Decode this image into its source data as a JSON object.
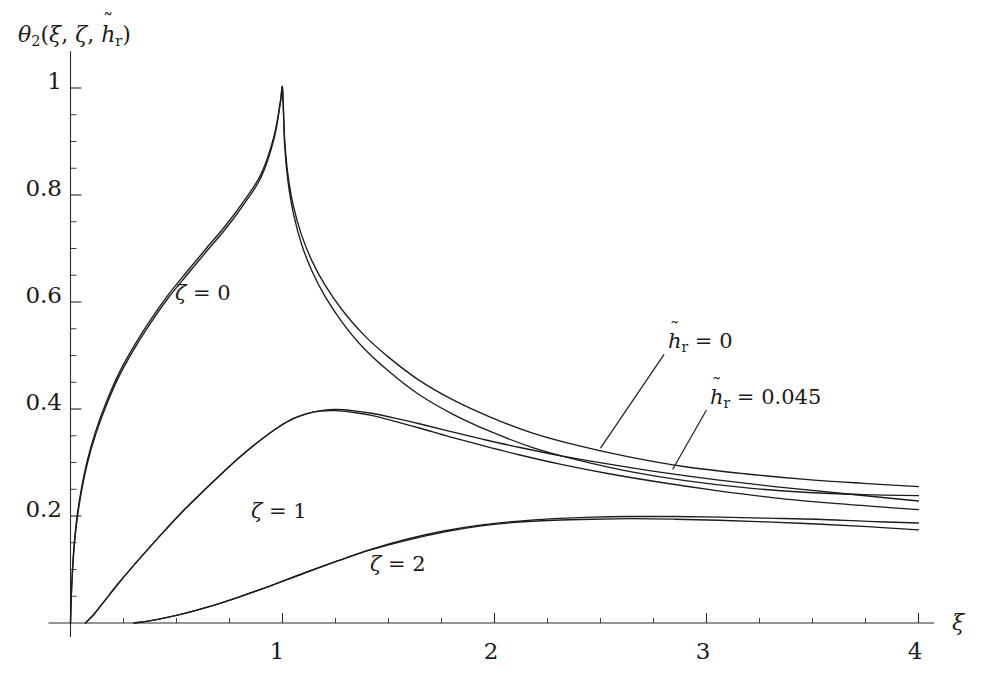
{
  "chart_data": {
    "type": "line",
    "title": "",
    "xlabel": "xi",
    "ylabel": "theta_2(xi, zeta, h_r_tilde)",
    "xlim": [
      0,
      4.05
    ],
    "ylim": [
      0,
      1.05
    ],
    "grid": false,
    "legend_position": "inline-annotations",
    "x_ticks_major": [
      0,
      1,
      2,
      3,
      4
    ],
    "x_tick_labels": [
      "",
      "1",
      "2",
      "3",
      "4"
    ],
    "x_minor_step": 0.25,
    "y_ticks_major": [
      0.2,
      0.4,
      0.6,
      0.8,
      1
    ],
    "y_tick_labels": [
      "0.2",
      "0.4",
      "0.6",
      "0.8",
      "1"
    ],
    "y_minor_step": 0.05,
    "annotations": [
      {
        "text": "h_r_tilde = 0",
        "x": 2.95,
        "y": 0.5
      },
      {
        "text": "h_r_tilde = 0.045",
        "x": 3.3,
        "y": 0.41
      },
      {
        "text": "zeta = 0",
        "x": 0.72,
        "y": 0.545
      },
      {
        "text": "zeta = 1",
        "x": 1.16,
        "y": 0.205
      },
      {
        "text": "zeta = 2",
        "x": 1.72,
        "y": 0.105
      }
    ],
    "series": [
      {
        "name": "zeta=0, h_r_tilde=0",
        "points": [
          [
            0.0,
            0.0
          ],
          [
            0.004,
            0.055
          ],
          [
            0.01,
            0.105
          ],
          [
            0.018,
            0.15
          ],
          [
            0.03,
            0.196
          ],
          [
            0.05,
            0.248
          ],
          [
            0.08,
            0.305
          ],
          [
            0.12,
            0.36
          ],
          [
            0.17,
            0.414
          ],
          [
            0.23,
            0.468
          ],
          [
            0.3,
            0.518
          ],
          [
            0.38,
            0.568
          ],
          [
            0.46,
            0.613
          ],
          [
            0.55,
            0.657
          ],
          [
            0.64,
            0.7
          ],
          [
            0.73,
            0.742
          ],
          [
            0.82,
            0.79
          ],
          [
            0.9,
            0.84
          ],
          [
            0.96,
            0.91
          ],
          [
            0.99,
            0.975
          ],
          [
            1.0,
            1.0
          ],
          [
            1.01,
            0.905
          ],
          [
            1.025,
            0.84
          ],
          [
            1.05,
            0.782
          ],
          [
            1.09,
            0.725
          ],
          [
            1.14,
            0.676
          ],
          [
            1.2,
            0.632
          ],
          [
            1.28,
            0.586
          ],
          [
            1.38,
            0.54
          ],
          [
            1.5,
            0.497
          ],
          [
            1.64,
            0.455
          ],
          [
            1.8,
            0.418
          ],
          [
            1.98,
            0.385
          ],
          [
            2.18,
            0.355
          ],
          [
            2.4,
            0.331
          ],
          [
            2.64,
            0.31
          ],
          [
            2.9,
            0.292
          ],
          [
            3.18,
            0.279
          ],
          [
            3.48,
            0.268
          ],
          [
            3.74,
            0.261
          ],
          [
            4.0,
            0.255
          ]
        ]
      },
      {
        "name": "zeta=0, h_r_tilde=0.045",
        "points": [
          [
            0.0,
            0.0
          ],
          [
            0.004,
            0.052
          ],
          [
            0.01,
            0.1
          ],
          [
            0.018,
            0.145
          ],
          [
            0.03,
            0.19
          ],
          [
            0.05,
            0.242
          ],
          [
            0.08,
            0.299
          ],
          [
            0.12,
            0.354
          ],
          [
            0.17,
            0.408
          ],
          [
            0.23,
            0.462
          ],
          [
            0.3,
            0.512
          ],
          [
            0.38,
            0.562
          ],
          [
            0.46,
            0.607
          ],
          [
            0.55,
            0.651
          ],
          [
            0.64,
            0.694
          ],
          [
            0.73,
            0.736
          ],
          [
            0.82,
            0.784
          ],
          [
            0.9,
            0.834
          ],
          [
            0.96,
            0.905
          ],
          [
            0.99,
            0.972
          ],
          [
            1.0,
            0.998
          ],
          [
            1.01,
            0.895
          ],
          [
            1.025,
            0.828
          ],
          [
            1.05,
            0.768
          ],
          [
            1.09,
            0.708
          ],
          [
            1.14,
            0.657
          ],
          [
            1.2,
            0.611
          ],
          [
            1.28,
            0.563
          ],
          [
            1.38,
            0.515
          ],
          [
            1.5,
            0.471
          ],
          [
            1.64,
            0.428
          ],
          [
            1.8,
            0.391
          ],
          [
            1.98,
            0.358
          ],
          [
            2.18,
            0.328
          ],
          [
            2.4,
            0.304
          ],
          [
            2.64,
            0.283
          ],
          [
            2.9,
            0.266
          ],
          [
            3.18,
            0.253
          ],
          [
            3.48,
            0.244
          ],
          [
            3.74,
            0.24
          ],
          [
            4.0,
            0.238
          ]
        ]
      },
      {
        "name": "zeta=1, h_r_tilde=0",
        "points": [
          [
            0.07,
            0.0
          ],
          [
            0.11,
            0.016
          ],
          [
            0.16,
            0.041
          ],
          [
            0.22,
            0.071
          ],
          [
            0.29,
            0.104
          ],
          [
            0.37,
            0.14
          ],
          [
            0.45,
            0.175
          ],
          [
            0.54,
            0.213
          ],
          [
            0.63,
            0.248
          ],
          [
            0.72,
            0.282
          ],
          [
            0.81,
            0.314
          ],
          [
            0.9,
            0.343
          ],
          [
            0.98,
            0.366
          ],
          [
            1.05,
            0.382
          ],
          [
            1.12,
            0.392
          ],
          [
            1.18,
            0.397
          ],
          [
            1.25,
            0.399
          ],
          [
            1.33,
            0.397
          ],
          [
            1.42,
            0.392
          ],
          [
            1.53,
            0.383
          ],
          [
            1.65,
            0.372
          ],
          [
            1.79,
            0.358
          ],
          [
            1.95,
            0.343
          ],
          [
            2.12,
            0.328
          ],
          [
            2.32,
            0.312
          ],
          [
            2.54,
            0.297
          ],
          [
            2.78,
            0.282
          ],
          [
            3.04,
            0.268
          ],
          [
            3.32,
            0.255
          ],
          [
            3.62,
            0.243
          ],
          [
            3.82,
            0.235
          ],
          [
            4.0,
            0.228
          ]
        ]
      },
      {
        "name": "zeta=1, h_r_tilde=0.045",
        "points": [
          [
            0.07,
            0.0
          ],
          [
            0.11,
            0.016
          ],
          [
            0.16,
            0.041
          ],
          [
            0.22,
            0.071
          ],
          [
            0.29,
            0.104
          ],
          [
            0.37,
            0.14
          ],
          [
            0.45,
            0.175
          ],
          [
            0.54,
            0.213
          ],
          [
            0.63,
            0.248
          ],
          [
            0.72,
            0.282
          ],
          [
            0.81,
            0.314
          ],
          [
            0.9,
            0.343
          ],
          [
            0.98,
            0.366
          ],
          [
            1.05,
            0.382
          ],
          [
            1.12,
            0.392
          ],
          [
            1.18,
            0.396
          ],
          [
            1.25,
            0.397
          ],
          [
            1.33,
            0.394
          ],
          [
            1.42,
            0.388
          ],
          [
            1.53,
            0.377
          ],
          [
            1.65,
            0.364
          ],
          [
            1.79,
            0.348
          ],
          [
            1.95,
            0.331
          ],
          [
            2.12,
            0.314
          ],
          [
            2.32,
            0.296
          ],
          [
            2.54,
            0.279
          ],
          [
            2.78,
            0.263
          ],
          [
            3.04,
            0.248
          ],
          [
            3.32,
            0.234
          ],
          [
            3.62,
            0.223
          ],
          [
            3.82,
            0.217
          ],
          [
            4.0,
            0.212
          ]
        ]
      },
      {
        "name": "zeta=2, h_r_tilde=0",
        "points": [
          [
            0.3,
            0.0
          ],
          [
            0.4,
            0.006
          ],
          [
            0.52,
            0.016
          ],
          [
            0.65,
            0.03
          ],
          [
            0.79,
            0.048
          ],
          [
            0.94,
            0.069
          ],
          [
            1.1,
            0.093
          ],
          [
            1.26,
            0.116
          ],
          [
            1.42,
            0.138
          ],
          [
            1.59,
            0.157
          ],
          [
            1.76,
            0.172
          ],
          [
            1.93,
            0.183
          ],
          [
            2.1,
            0.19
          ],
          [
            2.28,
            0.195
          ],
          [
            2.46,
            0.198
          ],
          [
            2.65,
            0.199
          ],
          [
            2.85,
            0.199
          ],
          [
            3.06,
            0.198
          ],
          [
            3.28,
            0.196
          ],
          [
            3.52,
            0.194
          ],
          [
            3.76,
            0.19
          ],
          [
            4.0,
            0.187
          ]
        ]
      },
      {
        "name": "zeta=2, h_r_tilde=0.045",
        "points": [
          [
            0.3,
            0.0
          ],
          [
            0.4,
            0.006
          ],
          [
            0.52,
            0.016
          ],
          [
            0.65,
            0.03
          ],
          [
            0.79,
            0.048
          ],
          [
            0.94,
            0.069
          ],
          [
            1.1,
            0.093
          ],
          [
            1.26,
            0.116
          ],
          [
            1.42,
            0.137
          ],
          [
            1.59,
            0.155
          ],
          [
            1.76,
            0.17
          ],
          [
            1.93,
            0.181
          ],
          [
            2.1,
            0.188
          ],
          [
            2.28,
            0.192
          ],
          [
            2.46,
            0.194
          ],
          [
            2.65,
            0.195
          ],
          [
            2.85,
            0.194
          ],
          [
            3.06,
            0.192
          ],
          [
            3.28,
            0.189
          ],
          [
            3.52,
            0.185
          ],
          [
            3.76,
            0.18
          ],
          [
            4.0,
            0.174
          ]
        ]
      }
    ]
  },
  "axis": {
    "y_title_parts": {
      "theta": "θ",
      "theta_sub": "2",
      "open": "(",
      "xi": "ξ",
      "comma1": ",",
      "zeta": "ζ",
      "comma2": ",",
      "h": "h",
      "h_sub": "r",
      "tilde": "˜",
      "close": ")"
    },
    "x_title": "ξ",
    "y_tick_labels": [
      "1",
      "0.8",
      "0.6",
      "0.4",
      "0.2"
    ],
    "x_tick_labels": [
      "1",
      "2",
      "3",
      "4"
    ]
  },
  "curve_labels": {
    "zeta0": {
      "sym": "ζ",
      "eq": "= 0"
    },
    "zeta1": {
      "sym": "ζ",
      "eq": "= 1"
    },
    "zeta2": {
      "sym": "ζ",
      "eq": "= 2"
    }
  },
  "annotations": {
    "h0": {
      "h": "h",
      "sub": "r",
      "tilde": "˜",
      "eq": "= 0"
    },
    "h045": {
      "h": "h",
      "sub": "r",
      "tilde": "˜",
      "eq": "= 0.045"
    }
  }
}
